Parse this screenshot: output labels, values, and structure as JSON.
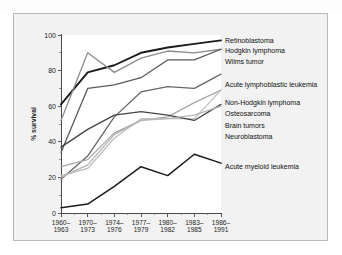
{
  "figure": {
    "panel_background": "#f2f2f2",
    "plot_background": "#ffffff",
    "border_color": "#b9b9b9"
  },
  "chart_data": {
    "type": "line",
    "title": "",
    "subtitle": "",
    "xlabel": "",
    "ylabel": "% survival",
    "ylim": [
      0,
      100
    ],
    "yticks": [
      0,
      20,
      40,
      60,
      80,
      100
    ],
    "ytick_labels": [
      "0",
      "20",
      "40",
      "60",
      "80",
      "100"
    ],
    "grid": false,
    "legend_position": "right-inline-labels",
    "categories": [
      "1960-\n1963",
      "1970-\n1973",
      "1974-\n1976",
      "1977-\n1979",
      "1980-\n1982",
      "1983-\n1985",
      "1986-\n1991"
    ],
    "xtick_labels": [
      [
        "1960–",
        "1963"
      ],
      [
        "1970–",
        "1973"
      ],
      [
        "1974–",
        "1976"
      ],
      [
        "1977–",
        "1979"
      ],
      [
        "1980–",
        "1982"
      ],
      [
        "1983–",
        "1985"
      ],
      [
        "1986–",
        "1991"
      ]
    ],
    "series": [
      {
        "name": "Retinoblastoma",
        "color": "#1a1a1a",
        "width": 1.9,
        "values": [
          61,
          79,
          83,
          90,
          93,
          95,
          97
        ],
        "label_y": 97
      },
      {
        "name": "Hodgkin lymphoma",
        "color": "#8c8c8c",
        "width": 1.3,
        "values": [
          52,
          90,
          79,
          87,
          91,
          90,
          92
        ],
        "label_y": 91
      },
      {
        "name": "Wilms tumor",
        "color": "#5a5a5a",
        "width": 1.3,
        "values": [
          34,
          70,
          72,
          76,
          86,
          86,
          92
        ],
        "label_y": 85
      },
      {
        "name": "Acute lymphoblastic leukemia",
        "color": "#666666",
        "width": 1.3,
        "values": [
          19,
          32,
          54,
          68,
          71,
          70,
          78
        ],
        "label_y": 72
      },
      {
        "name": "Non-Hodgkin lymphoma",
        "color": "#a8a8a8",
        "width": 1.3,
        "values": [
          26,
          30,
          45,
          52,
          54,
          62,
          69
        ],
        "label_y": 62
      },
      {
        "name": "Osteosarcoma",
        "color": "#c0c0c0",
        "width": 1.3,
        "values": [
          21,
          25,
          42,
          53,
          53,
          53,
          69
        ],
        "label_y": 56
      },
      {
        "name": "Brain tumors",
        "color": "#444444",
        "width": 1.3,
        "values": [
          37,
          47,
          55,
          57,
          55,
          52,
          61
        ],
        "label_y": 49
      },
      {
        "name": "Neuroblastoma",
        "color": "#b5b5b5",
        "width": 1.3,
        "values": [
          20,
          27,
          44,
          52,
          53,
          55,
          60
        ],
        "label_y": 43
      },
      {
        "name": "Acute myeloid leukemia",
        "color": "#1a1a1a",
        "width": 1.5,
        "values": [
          3,
          5,
          15,
          26,
          21,
          33,
          28
        ],
        "label_y": 26
      }
    ]
  }
}
